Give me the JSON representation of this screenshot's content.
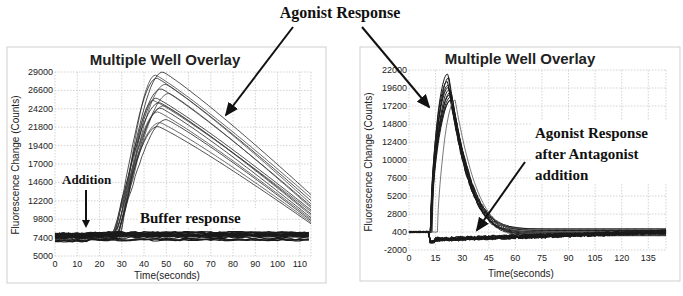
{
  "figure": {
    "top_annotation": "Agonist Response"
  },
  "chart_data": [
    {
      "type": "line",
      "title": "Multiple Well Overlay",
      "xlabel": "Time(seconds)",
      "ylabel": "Fluorescence Change (Counts)",
      "xlim": [
        0,
        115
      ],
      "ylim": [
        5000,
        29000
      ],
      "xticks": [
        0,
        10,
        20,
        30,
        40,
        50,
        60,
        70,
        80,
        90,
        100,
        110
      ],
      "yticks": [
        5000,
        7400,
        9800,
        12200,
        14600,
        17000,
        19400,
        21800,
        24200,
        26600,
        29000
      ],
      "grid": true,
      "annotations": [
        "Addition",
        "Buffer response",
        "Agonist Response"
      ],
      "addition_time": 14,
      "series": [
        {
          "name": "agonist wells",
          "baseline": 7400,
          "onset": 25,
          "peak_time": 48,
          "peak_values": [
            29000,
            28600,
            28200,
            27400,
            26800,
            26200,
            25600,
            25300,
            25000,
            24600,
            24300,
            23800,
            22800,
            22400,
            21900
          ],
          "end_values_at_115": [
            13000,
            12600,
            12200,
            11800,
            11500,
            11300,
            11000,
            10800,
            10500,
            10300,
            10000,
            9800,
            9600,
            9400,
            9200
          ]
        },
        {
          "name": "buffer wells",
          "baseline": 7400,
          "values_range": [
            6900,
            8100
          ],
          "flat": true
        }
      ]
    },
    {
      "type": "line",
      "title": "Multiple Well Overlay",
      "xlabel": "Time(seconds)",
      "ylabel": "Fluorescence Change (Counts)",
      "xlim": [
        0,
        145
      ],
      "ylim": [
        -2000,
        22000
      ],
      "xticks": [
        0,
        15,
        30,
        45,
        60,
        75,
        90,
        105,
        120,
        135
      ],
      "yticks": [
        -2000,
        400,
        2800,
        5200,
        7600,
        10000,
        12400,
        14800,
        17200,
        19600,
        22000
      ],
      "grid": true,
      "annotations": [
        "Agonist Response",
        "Agonist Response after Antagonist addition"
      ],
      "series": [
        {
          "name": "agonist wells",
          "baseline": 400,
          "onset": 12,
          "peak_time": 23,
          "peak_values": [
            21500,
            21000,
            20500,
            20000,
            19700,
            19400,
            19100,
            18800,
            18500,
            18200,
            18000
          ],
          "end_values_at_145": [
            800,
            600,
            400,
            300,
            200,
            100,
            0,
            -100
          ]
        },
        {
          "name": "antagonist-treated wells",
          "baseline": -300,
          "values_range": [
            -1200,
            600
          ],
          "flat": true
        }
      ]
    }
  ],
  "left_panel": {
    "title": "Multiple Well Overlay",
    "xlabel": "Time(seconds)",
    "ylabel": "Fluorescence Change (Counts)",
    "addition_label": "Addition",
    "buffer_label": "Buffer response"
  },
  "right_panel": {
    "title": "Multiple Well Overlay",
    "xlabel": "Time(seconds)",
    "ylabel": "Fluorescence Change (Counts)",
    "antagonist_label_lines": [
      "Agonist Response",
      "after Antagonist",
      "addition"
    ]
  }
}
